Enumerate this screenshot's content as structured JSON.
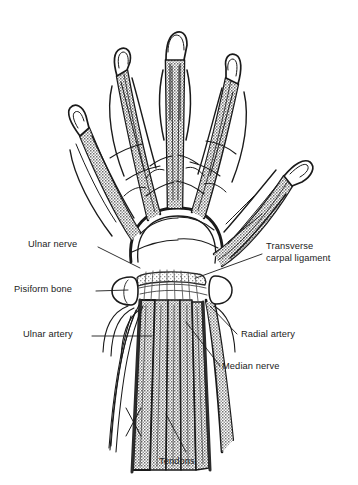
{
  "figure": {
    "type": "anatomical-line-drawing",
    "background_color": "#ffffff",
    "ink_color": "#1a1a1a",
    "fill_gray": "#8a8a8a",
    "stipple_gray": "#9b9b9b"
  },
  "labels": {
    "ulnar_nerve": "Ulnar nerve",
    "pisiform_bone": "Pisiform bone",
    "ulnar_artery": "Ulnar artery",
    "transverse_carpal_ligament_line1": "Transverse",
    "transverse_carpal_ligament_line2": "carpal ligament",
    "radial_artery": "Radial artery",
    "median_nerve": "Median nerve",
    "tendons": "Tendons"
  },
  "structures": [
    "thumb",
    "index-finger",
    "middle-finger",
    "ring-finger",
    "little-finger",
    "palmar-arch",
    "transverse-carpal-ligament",
    "pisiform-bone",
    "flexor-tendon-bundle",
    "ulnar-artery",
    "radial-artery",
    "median-nerve",
    "ulnar-nerve"
  ]
}
